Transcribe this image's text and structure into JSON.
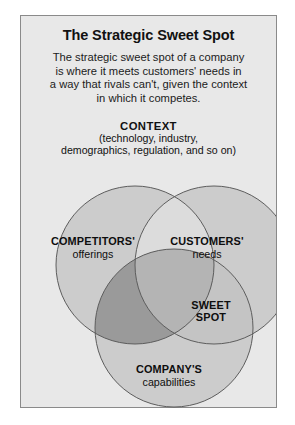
{
  "panel": {
    "title": "The Strategic Sweet Spot",
    "intro_lines": [
      "The strategic sweet spot of a company",
      "is where it meets customers' needs in",
      "a way that rivals can't, given the context",
      "in which it competes."
    ],
    "context": {
      "title": "CONTEXT",
      "subtitle_lines": [
        "(technology, industry,",
        "demographics, regulation, and so on)"
      ]
    }
  },
  "venn": {
    "circles": [
      {
        "id": "competitors",
        "name": "COMPETITORS'",
        "detail": "offerings",
        "cx": 114,
        "cy": 94,
        "r": 79
      },
      {
        "id": "customers",
        "name": "CUSTOMERS'",
        "detail": "needs",
        "cx": 193,
        "cy": 94,
        "r": 79
      },
      {
        "id": "company",
        "name": "COMPANY'S",
        "detail": "capabilities",
        "cx": 153,
        "cy": 157,
        "r": 79
      }
    ],
    "sweet_spot": {
      "line1": "SWEET",
      "line2": "SPOT"
    }
  },
  "colors": {
    "page_background": "#ffffff",
    "panel_background": "#e8e8e8",
    "panel_border": "#8a8a8a",
    "circle_fill": "#cccccc",
    "circle_stroke": "#5d5d5d",
    "overlap_pair_light": "#d8d8d8",
    "overlap_pair_dark": "#9a9a9a",
    "overlap_triple": "#b4b4b4",
    "text": "#111111"
  }
}
